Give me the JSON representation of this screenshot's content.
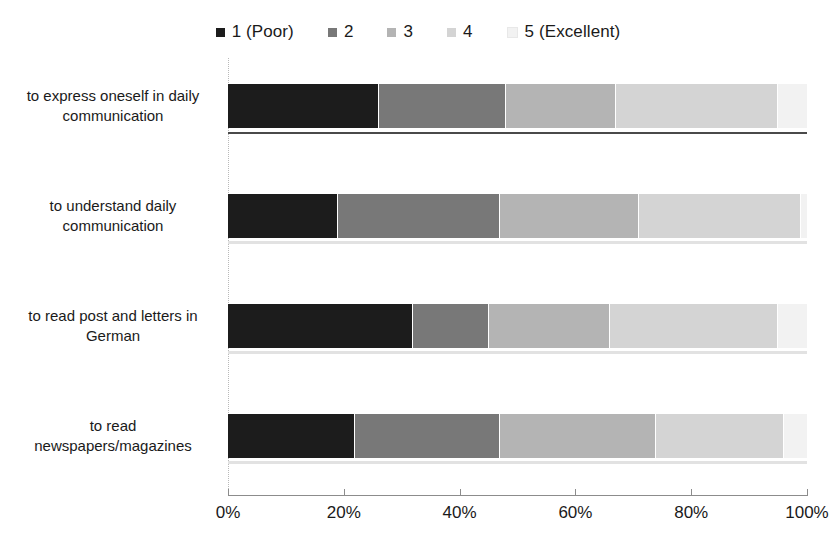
{
  "chart_data": {
    "type": "bar",
    "orientation": "horizontal",
    "stacked": true,
    "stack_mode": "percent",
    "title": "",
    "subtitle": "",
    "xlabel": "",
    "ylabel": "",
    "xlim": [
      0,
      100
    ],
    "xticks": [
      0,
      20,
      40,
      60,
      80,
      100
    ],
    "xtick_labels": [
      "0%",
      "20%",
      "40%",
      "60%",
      "80%",
      "100%"
    ],
    "grid": false,
    "legend_position": "top-center",
    "legend": [
      "1 (Poor)",
      "2",
      "3",
      "4",
      "5 (Excellent)"
    ],
    "categories": [
      "to express oneself in daily communication",
      "to understand daily communication",
      "to read post and letters in German",
      "to read newspapers/magazines"
    ],
    "category_label_lines": [
      [
        "to express oneself in daily",
        "communication"
      ],
      [
        "to understand daily",
        "communication"
      ],
      [
        "to read post and letters in",
        "German"
      ],
      [
        "to read",
        "newspapers/magazines"
      ]
    ],
    "series": [
      {
        "name": "1 (Poor)",
        "color": "#1c1c1c",
        "values": [
          26,
          19,
          32,
          22
        ]
      },
      {
        "name": "2",
        "color": "#787878",
        "values": [
          22,
          28,
          13,
          25
        ]
      },
      {
        "name": "3",
        "color": "#b4b4b4",
        "values": [
          19,
          24,
          21,
          27
        ]
      },
      {
        "name": "4",
        "color": "#d4d4d4",
        "values": [
          28,
          28,
          29,
          22
        ]
      },
      {
        "name": "5 (Excellent)",
        "color": "#f2f2f2",
        "values": [
          5,
          1,
          5,
          4
        ]
      }
    ]
  },
  "style": {
    "background": "#ffffff",
    "text_color": "#1a1a1a",
    "axis_color": "#8c8c8c",
    "baseline_color": "#e2e2e2"
  }
}
